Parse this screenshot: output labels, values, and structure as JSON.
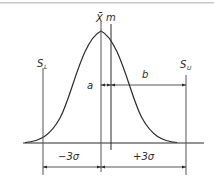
{
  "diagram": {
    "labels": {
      "mean": "X̄",
      "center": "m",
      "lower_spec": "S",
      "lower_spec_sub": "L",
      "upper_spec": "S",
      "upper_spec_sub": "U",
      "offset_a": "a",
      "distance_b": "b",
      "minus_three_sigma": "−3σ",
      "plus_three_sigma": "+3σ"
    },
    "colors": {
      "line": "#2a2a2a",
      "top_rule": "#c8c8c8",
      "background": "#ffffff"
    }
  }
}
